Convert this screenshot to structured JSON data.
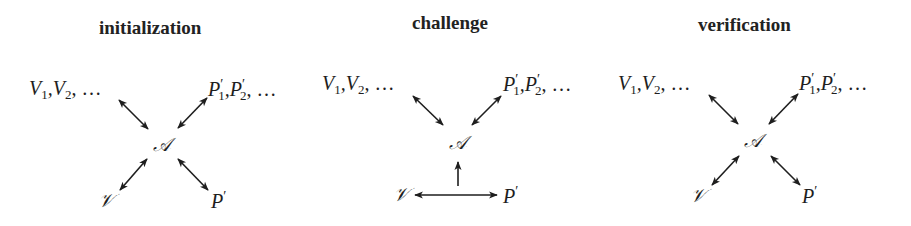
{
  "figure": {
    "panels": [
      {
        "id": "initialization",
        "title": "initialization",
        "nodes": {
          "verifiers": "V",
          "provers": "P",
          "adversary": "𝒜",
          "verifier": "𝒱",
          "prover": "P"
        },
        "edges": [
          {
            "from": "V1,V2,...",
            "to": "A",
            "type": "bidirectional"
          },
          {
            "from": "P'1,P'2,...",
            "to": "A",
            "type": "bidirectional"
          },
          {
            "from": "V",
            "to": "A",
            "type": "bidirectional"
          },
          {
            "from": "P'",
            "to": "A",
            "type": "bidirectional"
          }
        ]
      },
      {
        "id": "challenge",
        "title": "challenge",
        "nodes": {
          "verifiers": "V",
          "provers": "P",
          "adversary": "𝒜",
          "verifier": "𝒱",
          "prover": "P"
        },
        "edges": [
          {
            "from": "V1,V2,...",
            "to": "A",
            "type": "bidirectional"
          },
          {
            "from": "P'1,P'2,...",
            "to": "A",
            "type": "bidirectional"
          },
          {
            "from": "V",
            "to": "P'",
            "type": "bidirectional"
          },
          {
            "from": "V-P' channel",
            "to": "A",
            "type": "unidirectional"
          }
        ]
      },
      {
        "id": "verification",
        "title": "verification",
        "nodes": {
          "verifiers": "V",
          "provers": "P",
          "adversary": "𝒜",
          "verifier": "𝒱",
          "prover": "P"
        },
        "edges": [
          {
            "from": "V1,V2,...",
            "to": "A",
            "type": "bidirectional"
          },
          {
            "from": "P'1,P'2,...",
            "to": "A",
            "type": "bidirectional"
          },
          {
            "from": "V",
            "to": "A",
            "type": "bidirectional"
          },
          {
            "from": "P'",
            "to": "A",
            "type": "bidirectional"
          }
        ]
      }
    ],
    "labels": {
      "sub1": "1",
      "sub2": "2",
      "comma": ",",
      "ellipsis": ", …",
      "prime": "′"
    },
    "colors": {
      "ink": "#1e1e1e",
      "background": "#ffffff"
    }
  }
}
